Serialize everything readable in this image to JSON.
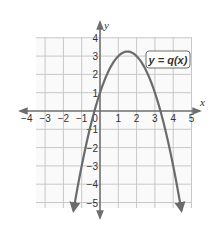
{
  "chart_data": {
    "type": "line",
    "title": "",
    "xlabel": "x",
    "ylabel": "y",
    "xlim": [
      -4,
      5
    ],
    "ylim": [
      -5,
      4
    ],
    "grid": true,
    "x_ticks": [
      -4,
      -3,
      -2,
      -1,
      0,
      1,
      2,
      3,
      4,
      5
    ],
    "y_ticks": [
      4,
      3,
      2,
      1,
      -1,
      -2,
      -3,
      -4,
      -5
    ],
    "x_tick_labels": [
      "−4",
      "−3",
      "−2",
      "−1",
      "0",
      "1",
      "2",
      "3",
      "4",
      "5"
    ],
    "y_tick_labels": [
      "4",
      "3",
      "2",
      "1",
      "−1",
      "−2",
      "−3",
      "−4",
      "−5"
    ],
    "series": [
      {
        "name": "y = q(x)",
        "kind": "parabola opening downward",
        "vertex": [
          1.5,
          3.25
        ],
        "y_intercept": 1,
        "x_intercepts": [
          -0.3,
          3.3
        ],
        "x": [
          -1.4,
          -1,
          -0.3,
          0,
          0.5,
          1,
          1.5,
          2,
          2.5,
          3,
          3.3,
          4,
          4.4
        ],
        "y": [
          -3.2,
          -2.0,
          0,
          1.0,
          2.25,
          3.0,
          3.25,
          3.0,
          2.25,
          1.0,
          0,
          -3.0,
          -4.9
        ],
        "color": "#6b6b6b",
        "arrows_at_ends": true
      }
    ],
    "annotations": [
      {
        "text": "y = q(x)",
        "boxed": true,
        "position": [
          3.6,
          2.7
        ]
      }
    ]
  },
  "labels": {
    "x_axis": "x",
    "y_axis": "y",
    "function": "y = q(x)"
  },
  "colors": {
    "grid": "#c8c8c8",
    "axes": "#6e6e6e",
    "curve": "#6b6b6b",
    "text": "#333333",
    "plot_bg": "#fafafa"
  }
}
